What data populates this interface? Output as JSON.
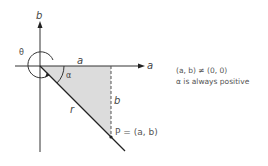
{
  "diagram": {
    "axes": {
      "x_label": "a",
      "y_label": "b"
    },
    "labels": {
      "theta": "θ",
      "alpha": "α",
      "top_side": "a",
      "vertical_side": "b",
      "hypotenuse": "r",
      "point": "P = (a, b)"
    },
    "notes": [
      "(a, b) ≠ (0, 0)",
      "α is always positive"
    ],
    "colors": {
      "axis": "#333333",
      "shade": "#d9d9d9",
      "line": "#222222",
      "text": "#555555"
    }
  }
}
